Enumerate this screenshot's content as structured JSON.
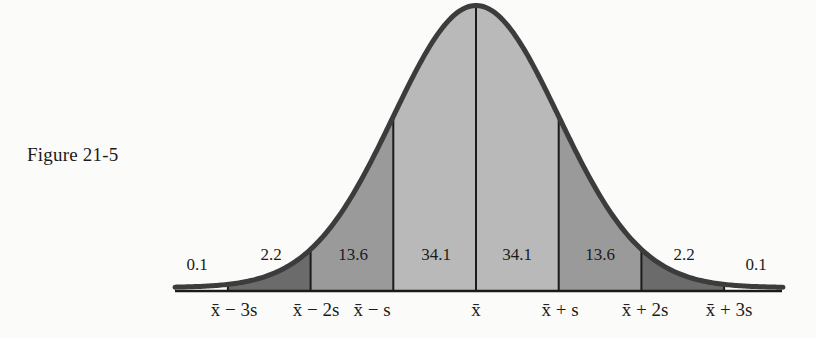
{
  "figure": {
    "label": "Figure 21-5"
  },
  "colors": {
    "curve": "#3c3c3c",
    "axis": "#1b1b1b",
    "band_1s": "#b9b9b9",
    "band_2s": "#9a9a9a",
    "band_3s": "#6b6b6b",
    "outer_tail": "#fbfbf9"
  },
  "chart_data": {
    "type": "area",
    "title": "Figure 21-5",
    "xlabel": "",
    "ylabel": "",
    "x_ticks": [
      "x̄ − 3s",
      "x̄ − 2s",
      "x̄ − s",
      "x̄",
      "x̄ + s",
      "x̄ + 2s",
      "x̄ + 3s"
    ],
    "x_tick_values_sd": [
      -3,
      -2,
      -1,
      0,
      1,
      2,
      3
    ],
    "bands": [
      {
        "range": "< x̄ − 3s",
        "percent": 0.1
      },
      {
        "range": "x̄ − 3s to x̄ − 2s",
        "percent": 2.2
      },
      {
        "range": "x̄ − 2s to x̄ − s",
        "percent": 13.6
      },
      {
        "range": "x̄ − s to x̄",
        "percent": 34.1
      },
      {
        "range": "x̄ to x̄ + s",
        "percent": 34.1
      },
      {
        "range": "x̄ + s to x̄ + 2s",
        "percent": 13.6
      },
      {
        "range": "x̄ + 2s to x̄ + 3s",
        "percent": 2.2
      },
      {
        "range": "> x̄ + 3s",
        "percent": 0.1
      }
    ],
    "band_labels": [
      "0.1",
      "2.2",
      "13.6",
      "34.1",
      "34.1",
      "13.6",
      "2.2",
      "0.1"
    ],
    "grid": false,
    "legend": null
  }
}
